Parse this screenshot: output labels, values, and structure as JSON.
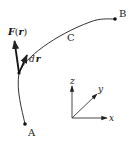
{
  "diagram": {
    "type": "line-integral-path",
    "colors": {
      "stroke": "#333333",
      "background": "#ffffff"
    },
    "points": {
      "start": {
        "label": "A"
      },
      "end": {
        "label": "B"
      }
    },
    "curve": {
      "label": "C"
    },
    "vectors": {
      "force": {
        "label_main": "F",
        "label_paren_open": "(",
        "label_arg": "r",
        "label_paren_close": ")"
      },
      "displacement": {
        "label_d": "d",
        "label_r": "r"
      }
    },
    "axes": {
      "x": "x",
      "y": "y",
      "z": "z"
    }
  }
}
